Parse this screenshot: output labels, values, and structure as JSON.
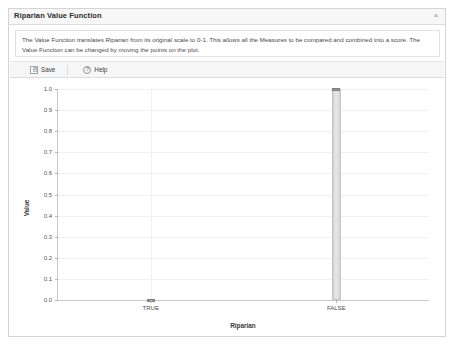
{
  "window": {
    "title": "Riparian Value Function",
    "close_label": "×"
  },
  "description": {
    "text": "The Value Function translates Riparian from its original scale to 0-1. This allows all the Measures to be compared and combined into a score. The Value Function can be changed by moving the points on the plot."
  },
  "toolbar": {
    "save_label": "Save",
    "help_label": "Help"
  },
  "chart_data": {
    "type": "bar",
    "title": "",
    "xlabel": "Riparian",
    "ylabel": "Value",
    "categories": [
      "TRUE",
      "FALSE"
    ],
    "values": [
      0.0,
      1.0
    ],
    "ylim": [
      0.0,
      1.0
    ],
    "yticks": [
      "0.0",
      "0.1",
      "0.2",
      "0.3",
      "0.4",
      "0.5",
      "0.6",
      "0.7",
      "0.8",
      "0.9",
      "1.0"
    ],
    "ytick_values": [
      0.0,
      0.1,
      0.2,
      0.3,
      0.4,
      0.5,
      0.6,
      0.7,
      0.8,
      0.9,
      1.0
    ],
    "grid": true,
    "legend": "none",
    "bar_color": "#dcdcdc",
    "handle_color": "#9a9a9a"
  }
}
